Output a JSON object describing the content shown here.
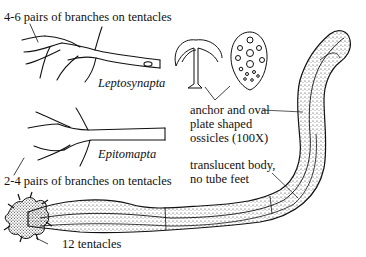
{
  "figure": {
    "labels": {
      "leptosynapta_tentacle_note": "4-6 pairs of branches on tentacles",
      "leptosynapta_name": "Leptosynapta",
      "epitomapta_name": "Epitomapta",
      "epitomapta_tentacle_note": "2-4 pairs of branches on tentacles",
      "tentacle_count": "12  tentacles",
      "ossicles_line1": "anchor and oval",
      "ossicles_line2": "plate shaped",
      "ossicles_line3": "ossicles (100X)",
      "body_line1": "translucent body,",
      "body_line2": "no tube feet"
    },
    "parts": [
      "leptosynapta-tentacle",
      "epitomapta-tentacle",
      "anchor-ossicle",
      "oval-plate-ossicle",
      "sea-cucumber-body",
      "tentacle-crown"
    ],
    "colors": {
      "ink": "#111111",
      "background": "#ffffff",
      "stipple": "#2a2a2a"
    }
  }
}
